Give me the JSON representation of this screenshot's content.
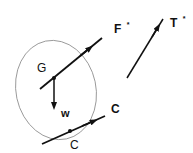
{
  "diagram": {
    "type": "free-body diagram",
    "colors": {
      "ink": "#111111",
      "outline": "#8a8a8a",
      "background": "#ffffff"
    },
    "body": {
      "shape": "ellipse",
      "label": ""
    },
    "points": {
      "G": {
        "label": "G"
      },
      "C": {
        "label": "C"
      }
    },
    "vectors": {
      "F_star": {
        "label": "F",
        "superscript": "*"
      },
      "T_star": {
        "label": "T",
        "superscript": "*"
      },
      "w": {
        "label": "w"
      },
      "C": {
        "label": "C"
      }
    }
  }
}
